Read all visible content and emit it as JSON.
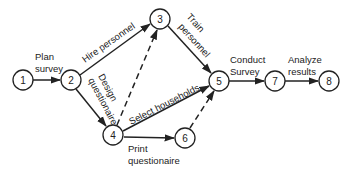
{
  "diagram": {
    "type": "activity-network",
    "nodes": [
      {
        "id": "1",
        "label": "1",
        "x": 23,
        "y": 80
      },
      {
        "id": "2",
        "label": "2",
        "x": 71,
        "y": 80
      },
      {
        "id": "3",
        "label": "3",
        "x": 160,
        "y": 19
      },
      {
        "id": "4",
        "label": "4",
        "x": 113,
        "y": 135
      },
      {
        "id": "5",
        "label": "5",
        "x": 219,
        "y": 81
      },
      {
        "id": "6",
        "label": "6",
        "x": 185,
        "y": 138
      },
      {
        "id": "7",
        "label": "7",
        "x": 275,
        "y": 81
      },
      {
        "id": "8",
        "label": "8",
        "x": 329,
        "y": 81
      }
    ],
    "edges": [
      {
        "from": "1",
        "to": "2",
        "style": "solid",
        "label": "Plan survey"
      },
      {
        "from": "2",
        "to": "3",
        "style": "solid",
        "label": "Hire personnel"
      },
      {
        "from": "2",
        "to": "4",
        "style": "solid",
        "label": "Design questionaire"
      },
      {
        "from": "3",
        "to": "5",
        "style": "solid",
        "label": "Train personnel"
      },
      {
        "from": "4",
        "to": "3",
        "style": "dashed",
        "label": ""
      },
      {
        "from": "4",
        "to": "5",
        "style": "solid",
        "label": "Select households"
      },
      {
        "from": "4",
        "to": "6",
        "style": "solid",
        "label": "Print questionaire"
      },
      {
        "from": "6",
        "to": "5",
        "style": "dashed",
        "label": ""
      },
      {
        "from": "5",
        "to": "7",
        "style": "solid",
        "label": "Conduct Survey"
      },
      {
        "from": "7",
        "to": "8",
        "style": "solid",
        "label": "Analyze results"
      }
    ]
  },
  "labels": {
    "plan_1": "Plan",
    "plan_2": "survey",
    "hire": "Hire personnel",
    "design_1": "Design",
    "design_2": "questionaire",
    "train_1": "Train",
    "train_2": "personnel",
    "select": "Select households",
    "print_1": "Print",
    "print_2": "questionaire",
    "conduct_1": "Conduct",
    "conduct_2": "Survey",
    "analyze_1": "Analyze",
    "analyze_2": "results"
  },
  "node_labels": {
    "n1": "1",
    "n2": "2",
    "n3": "3",
    "n4": "4",
    "n5": "5",
    "n6": "6",
    "n7": "7",
    "n8": "8"
  }
}
